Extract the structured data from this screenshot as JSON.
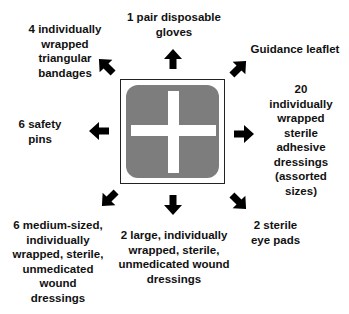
{
  "diagram": {
    "center_icon": "first-aid-cross-icon",
    "colors": {
      "kit_fill": "#7d7d7d",
      "cross": "#ffffff",
      "text": "#111111",
      "arrow": "#000000"
    },
    "items": [
      {
        "id": "top",
        "text": "1 pair disposable gloves",
        "lines": [
          "1 pair disposable",
          "gloves"
        ]
      },
      {
        "id": "top-left",
        "text": "4 individually wrapped triangular bandages",
        "lines": [
          "4 individually",
          "wrapped",
          "triangular",
          "bandages"
        ]
      },
      {
        "id": "top-right",
        "text": "Guidance leaflet",
        "lines": [
          "Guidance leaflet"
        ]
      },
      {
        "id": "left",
        "text": "6 safety pins",
        "lines": [
          "6 safety",
          "pins"
        ]
      },
      {
        "id": "right",
        "text": "20 individually wrapped sterile adhesive dressings (assorted sizes)",
        "lines": [
          "20",
          "individually",
          "wrapped",
          "sterile",
          "adhesive",
          "dressings",
          "(assorted",
          "sizes)"
        ]
      },
      {
        "id": "bottom-left",
        "text": "6 medium-sized, individually wrapped, sterile, unmedicated wound dressings",
        "lines": [
          "6 medium-sized,",
          "individually",
          "wrapped, sterile,",
          "unmedicated",
          "wound",
          "dressings"
        ]
      },
      {
        "id": "bottom",
        "text": "2 large, individually wrapped, sterile, unmedicated wound dressings",
        "lines": [
          "2 large, individually",
          "wrapped, sterile,",
          "unmedicated wound",
          "dressings"
        ]
      },
      {
        "id": "bottom-right",
        "text": "2 sterile eye pads",
        "lines": [
          "2 sterile",
          "eye pads"
        ]
      }
    ]
  }
}
